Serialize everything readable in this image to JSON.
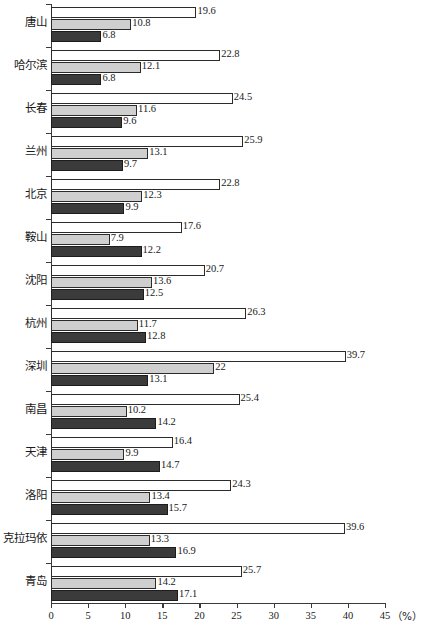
{
  "chart_data": {
    "type": "bar",
    "orientation": "horizontal",
    "title": "",
    "subtitle": "",
    "xlabel": "",
    "ylabel": "",
    "unit_label": "（%）",
    "xlim": [
      0,
      45
    ],
    "xticks": [
      0,
      5,
      10,
      15,
      20,
      25,
      30,
      35,
      40,
      45
    ],
    "xtick_labels": [
      "0",
      "5",
      "10",
      "15",
      "20",
      "25",
      "30",
      "35",
      "40",
      "45"
    ],
    "grid": false,
    "legend": "none",
    "categories": [
      "唐山",
      "哈尔滨",
      "长春",
      "兰州",
      "北京",
      "鞍山",
      "沈阳",
      "杭州",
      "深圳",
      "南昌",
      "天津",
      "洛阳",
      "克拉玛依",
      "青岛"
    ],
    "series": [
      {
        "name": "series-1",
        "color": "#ffffff",
        "values": [
          19.6,
          22.8,
          24.5,
          25.9,
          22.8,
          17.6,
          20.7,
          26.3,
          39.7,
          25.4,
          16.4,
          24.3,
          39.6,
          25.7
        ],
        "labels": [
          "19.6",
          "22.8",
          "24.5",
          "25.9",
          "22.8",
          "17.6",
          "20.7",
          "26.3",
          "39.7",
          "25.4",
          "16.4",
          "24.3",
          "39.6",
          "25.7"
        ]
      },
      {
        "name": "series-2",
        "color": "#cfcfcf",
        "values": [
          10.8,
          12.1,
          11.6,
          13.1,
          12.3,
          7.9,
          13.6,
          11.7,
          22,
          10.2,
          9.9,
          13.4,
          13.3,
          14.2
        ],
        "labels": [
          "10.8",
          "12.1",
          "11.6",
          "13.1",
          "12.3",
          "7.9",
          "13.6",
          "11.7",
          "22",
          "10.2",
          "9.9",
          "13.4",
          "13.3",
          "14.2"
        ]
      },
      {
        "name": "series-3",
        "color": "#3b3b3b",
        "values": [
          6.8,
          6.8,
          9.6,
          9.7,
          9.9,
          12.2,
          12.5,
          12.8,
          13.1,
          14.2,
          14.7,
          15.7,
          16.9,
          17.1
        ],
        "labels": [
          "6.8",
          "6.8",
          "9.6",
          "9.7",
          "9.9",
          "12.2",
          "12.5",
          "12.8",
          "13.1",
          "14.2",
          "14.7",
          "15.7",
          "16.9",
          "17.1"
        ]
      }
    ]
  }
}
